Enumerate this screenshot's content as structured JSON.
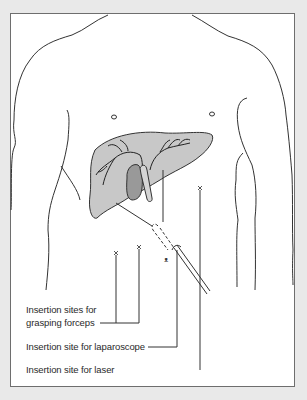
{
  "figure": {
    "colors": {
      "background": "#e9e9e9",
      "frame_fill": "#ffffff",
      "frame_border": "#6e6e6e",
      "outline": "#333333",
      "liver_fill": "#c8c8c8",
      "gallbladder_fill": "#999999"
    },
    "labels": {
      "forceps_line1": "Insertion sites for",
      "forceps_line2": "grasping forceps",
      "laparoscope": "Insertion site for laparoscope",
      "laser": "Insertion site for laser"
    },
    "markers": {
      "forceps_marks": [
        "×",
        "×"
      ],
      "laser_mark": "×"
    }
  }
}
